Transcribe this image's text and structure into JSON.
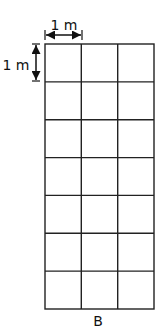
{
  "diagram": {
    "grid": {
      "rows": 7,
      "columns": 3,
      "cell_size_label": "1 m",
      "line_color": "#222222"
    },
    "dimensions": {
      "horizontal_label": "1 m",
      "vertical_label": "1 m"
    },
    "caption": "B"
  }
}
